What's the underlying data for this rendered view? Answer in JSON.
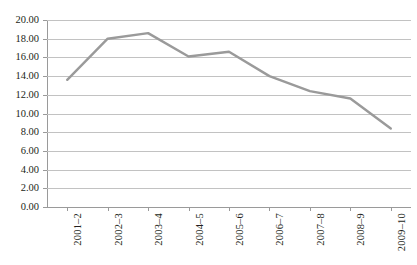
{
  "chart_data": {
    "type": "line",
    "title": "",
    "subtitle": "",
    "xlabel": "",
    "ylabel": "",
    "categories": [
      "2001–2",
      "2002–3",
      "2003–4",
      "2004–5",
      "2005–6",
      "2006–7",
      "2007–8",
      "2008–9",
      "2009–10"
    ],
    "values": [
      13.6,
      18.0,
      18.6,
      16.1,
      16.6,
      14.0,
      12.4,
      11.6,
      8.4
    ],
    "series": [
      {
        "name": "",
        "values": [
          13.6,
          18.0,
          18.6,
          16.1,
          16.6,
          14.0,
          12.4,
          11.6,
          8.4
        ]
      }
    ],
    "ylim": [
      0.0,
      20.0
    ],
    "ytick_step": 2.0,
    "ytick_labels": [
      "20.00",
      "18.00",
      "16.00",
      "14.00",
      "12.00",
      "10.00",
      "8.00",
      "6.00",
      "4.00",
      "2.00",
      "0.00"
    ],
    "ytick_values": [
      20.0,
      18.0,
      16.0,
      14.0,
      12.0,
      10.0,
      8.0,
      6.0,
      4.0,
      2.0,
      0.0
    ],
    "grid": "horizontal",
    "legend": "none",
    "legend_position": "",
    "annotations": [],
    "line_color": "#9a9a9a",
    "grid_color": "#c2c2c2",
    "axis_color": "#9a9a9a",
    "background_color": "#ffffff",
    "text_color": "#231f20",
    "xtick_label_rotation": -90
  }
}
